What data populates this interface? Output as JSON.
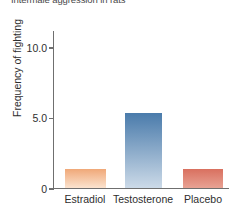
{
  "chart_data": {
    "type": "bar",
    "title": "Intermale aggression in rats",
    "xlabel": "",
    "ylabel": "Frequency of fighting",
    "categories": [
      "Estradiol",
      "Testosterone",
      "Placebo"
    ],
    "values": [
      1.3,
      5.3,
      1.3
    ],
    "ylim": [
      0,
      11.2
    ],
    "ytick_values": [
      0,
      5,
      10
    ],
    "ytick_labels": [
      "0",
      "5.0",
      "10.0"
    ],
    "grid": false,
    "legend": "none",
    "bar_colors": [
      "#f0a878",
      "#5b84b1",
      "#d9705f"
    ],
    "bar_gradients": [
      {
        "top": "#f0a878",
        "bottom": "#fbe3cf"
      },
      {
        "top": "#4a7bab",
        "bottom": "#ccdae8"
      },
      {
        "top": "#d9705f",
        "bottom": "#e8a294"
      }
    ],
    "axis_color": "#6f6f6f",
    "background": "#ffffff"
  }
}
